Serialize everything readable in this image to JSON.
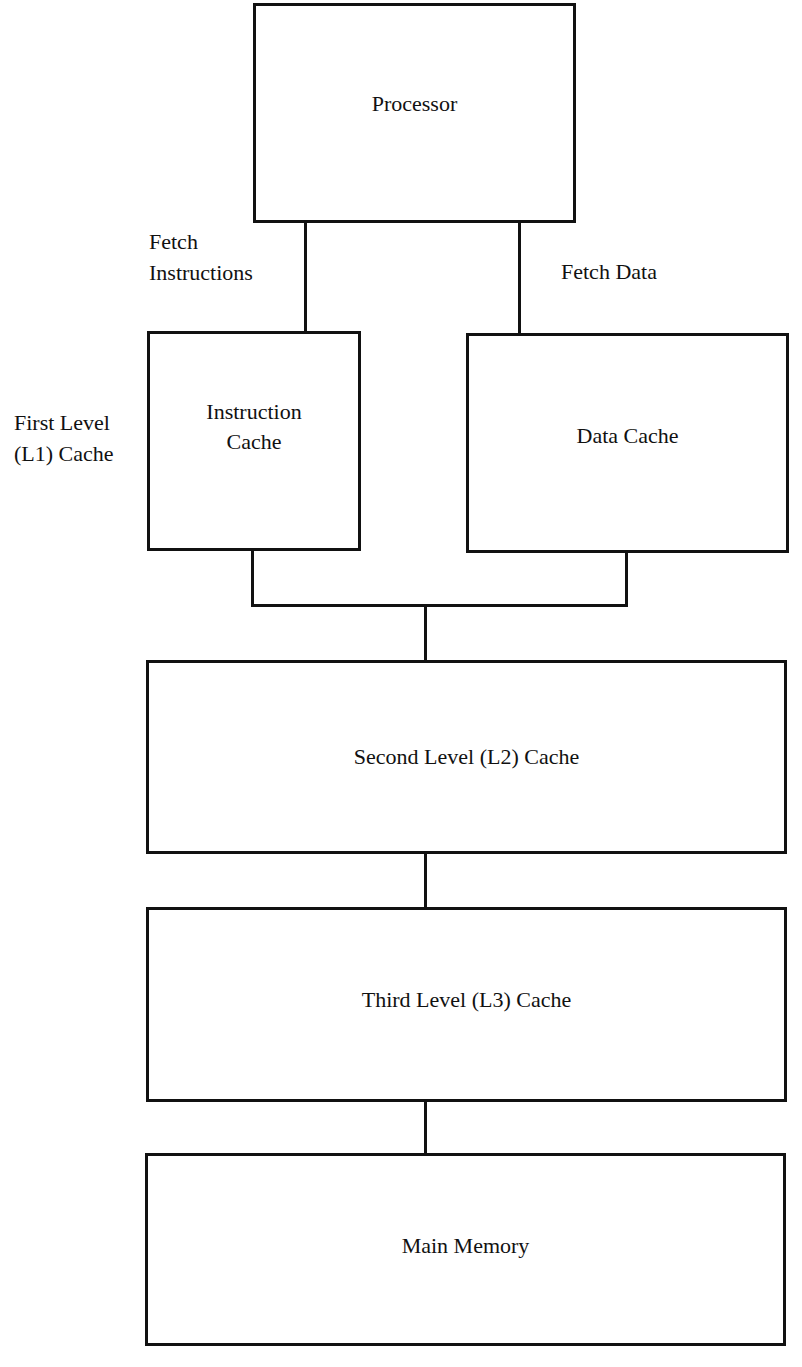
{
  "diagram": {
    "nodes": {
      "processor": "Processor",
      "instruction_cache": "Instruction\nCache",
      "data_cache": "Data Cache",
      "l2_cache": "Second Level (L2) Cache",
      "l3_cache": "Third Level (L3) Cache",
      "main_memory": "Main Memory"
    },
    "labels": {
      "fetch_instructions": "Fetch\nInstructions",
      "fetch_data": "Fetch Data",
      "l1_group": "First Level\n(L1) Cache"
    },
    "edges": [
      {
        "from": "processor",
        "to": "instruction_cache",
        "label": "Fetch Instructions"
      },
      {
        "from": "processor",
        "to": "data_cache",
        "label": "Fetch Data"
      },
      {
        "from": "instruction_cache",
        "to": "l2_cache"
      },
      {
        "from": "data_cache",
        "to": "l2_cache"
      },
      {
        "from": "l2_cache",
        "to": "l3_cache"
      },
      {
        "from": "l3_cache",
        "to": "main_memory"
      }
    ]
  }
}
